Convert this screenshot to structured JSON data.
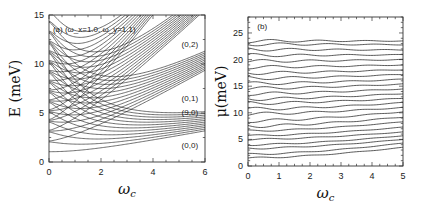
{
  "chart_data": [
    {
      "type": "line",
      "panel": "(a)",
      "annotation": "(a) (ω_x=1.0, ω_y=1.1)",
      "title": "",
      "xlabel": "ω_c",
      "ylabel": "E (meV)",
      "xlim": [
        0,
        6
      ],
      "ylim": [
        0,
        15
      ],
      "xticks": [
        "0",
        "2",
        "4",
        "6"
      ],
      "yticks": [
        "0",
        "5",
        "10",
        "15"
      ],
      "grid": false,
      "band_labels": [
        {
          "text": "(0,2)",
          "x": 5.1,
          "y": 11.7
        },
        {
          "text": "(0,1)",
          "x": 5.1,
          "y": 6.2
        },
        {
          "text": "(9,0)",
          "x": 5.1,
          "y": 4.8
        },
        {
          "text": "(0,0)",
          "x": 5.1,
          "y": 1.4
        }
      ],
      "description": "Single-particle energy levels vs cyclotron frequency; ~12 levels start at omega_c=0 between 1 and 12.3 meV, crossing and fanning into Landau-like bands (0,0)..(9,0) rising slowly to ~3-4.5 meV, (0,1) band rising to ~9.5-11 meV, (0,2) band rising steeply past 15 meV.",
      "series": [
        {
          "name": "(0,0) band",
          "x": [
            0,
            1,
            2,
            3,
            4,
            5,
            6
          ],
          "values": [
            1.0,
            1.2,
            1.5,
            1.9,
            2.3,
            2.7,
            3.1
          ]
        },
        {
          "name": "(9,0) band top",
          "x": [
            0,
            1,
            2,
            3,
            4,
            5,
            6
          ],
          "values": [
            10.5,
            6.5,
            5.0,
            4.6,
            4.6,
            4.6,
            4.7
          ]
        },
        {
          "name": "(0,1) band bottom",
          "x": [
            0,
            1,
            2,
            3,
            4,
            5,
            6
          ],
          "values": [
            2.1,
            4.5,
            6.5,
            7.5,
            8.3,
            9.0,
            9.6
          ]
        },
        {
          "name": "(0,1) band top",
          "x": [
            0,
            1,
            2,
            3,
            4,
            5,
            6
          ],
          "values": [
            11.2,
            8.5,
            8.0,
            8.7,
            9.5,
            10.3,
            11.0
          ]
        },
        {
          "name": "(0,2) band bottom",
          "x": [
            0,
            1,
            2,
            3,
            4,
            5,
            6
          ],
          "values": [
            3.2,
            5.8,
            8.5,
            10.5,
            12.0,
            13.5,
            15.0
          ]
        },
        {
          "name": "(0,2) band top",
          "x": [
            0,
            1,
            2,
            3,
            4,
            5
          ],
          "values": [
            12.3,
            10.4,
            11.0,
            12.5,
            14.0,
            15.0
          ]
        }
      ]
    },
    {
      "type": "line",
      "panel": "(b)",
      "annotation": "(b)",
      "title": "",
      "xlabel": "ω_c",
      "ylabel": "μ(meV)",
      "xlim": [
        0,
        5
      ],
      "ylim": [
        0,
        28
      ],
      "xticks": [
        "0",
        "1",
        "2",
        "3",
        "4",
        "5"
      ],
      "yticks": [
        "0",
        "5",
        "10",
        "15",
        "20",
        "25"
      ],
      "grid": false,
      "description": "Chemical potential vs omega_c for successive electron numbers; ~22 nearly horizontal wavy lines from ~1.5 to ~23.5 meV, lower lines curving upward at large omega_c.",
      "series_levels_at_x0": [
        1.5,
        2.2,
        3.3,
        4.0,
        5.0,
        5.7,
        6.6,
        7.5,
        8.5,
        9.8,
        10.7,
        11.8,
        12.6,
        13.6,
        14.6,
        15.5,
        16.5,
        17.5,
        18.6,
        19.7,
        20.8,
        21.9,
        22.9,
        23.5
      ],
      "series_levels_at_x5": [
        3.5,
        4.3,
        5.0,
        5.7,
        6.4,
        7.3,
        8.3,
        9.2,
        10.2,
        11.0,
        11.9,
        12.7,
        13.6,
        14.5,
        15.4,
        16.3,
        17.2,
        18.1,
        19.0,
        20.0,
        20.9,
        21.8,
        22.8,
        23.5
      ]
    }
  ]
}
